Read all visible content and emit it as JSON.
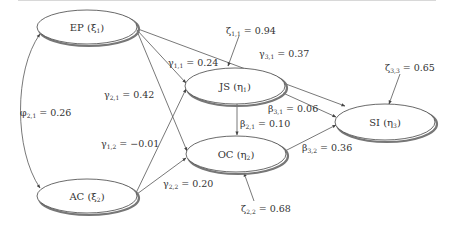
{
  "diagram": {
    "type": "structural-equation-model",
    "nodes": [
      {
        "id": "EP",
        "label": "EP",
        "symbol": "ξ",
        "sub": "1",
        "cx": 87,
        "cy": 27,
        "rx": 50,
        "ry": 17
      },
      {
        "id": "AC",
        "label": "AC",
        "symbol": "ξ",
        "sub": "2",
        "cx": 87,
        "cy": 196,
        "rx": 50,
        "ry": 17
      },
      {
        "id": "JS",
        "label": "JS",
        "symbol": "η",
        "sub": "1",
        "cx": 235,
        "cy": 86,
        "rx": 50,
        "ry": 18
      },
      {
        "id": "OC",
        "label": "OC",
        "symbol": "η",
        "sub": "2",
        "cx": 236,
        "cy": 154,
        "rx": 50,
        "ry": 18
      },
      {
        "id": "SI",
        "label": "SI",
        "symbol": "η",
        "sub": "3",
        "cx": 385,
        "cy": 122,
        "rx": 50,
        "ry": 18
      }
    ],
    "edges": [
      {
        "id": "phi21",
        "from": "EP",
        "to": "AC",
        "symbol": "φ",
        "sub": "2,1",
        "value": "0.26",
        "label": "φ2,1 = 0.26",
        "bidirectional": true
      },
      {
        "id": "gamma11",
        "from": "EP",
        "to": "JS",
        "symbol": "γ",
        "sub": "1,1",
        "value": "0.24",
        "label": "γ1,1 = 0.24"
      },
      {
        "id": "gamma21",
        "from": "EP",
        "to": "OC",
        "symbol": "γ",
        "sub": "2,1",
        "value": "0.42",
        "label": "γ2,1 = 0.42"
      },
      {
        "id": "gamma31",
        "from": "EP",
        "to": "SI",
        "symbol": "γ",
        "sub": "3,1",
        "value": "0.37",
        "label": "γ3,1 = 0.37"
      },
      {
        "id": "gamma12",
        "from": "AC",
        "to": "JS",
        "symbol": "γ",
        "sub": "1,2",
        "value": "−0.01",
        "label": "γ1,2 = −0.01"
      },
      {
        "id": "gamma22",
        "from": "AC",
        "to": "OC",
        "symbol": "γ",
        "sub": "2,2",
        "value": "0.20",
        "label": "γ2,2 = 0.20"
      },
      {
        "id": "beta21",
        "from": "JS",
        "to": "OC",
        "symbol": "β",
        "sub": "2,1",
        "value": "0.10",
        "label": "β2,1 = 0.10"
      },
      {
        "id": "beta31",
        "from": "JS",
        "to": "SI",
        "symbol": "β",
        "sub": "3,1",
        "value": "0.06",
        "label": "β3,1 = 0.06"
      },
      {
        "id": "beta32",
        "from": "OC",
        "to": "SI",
        "symbol": "β",
        "sub": "3,2",
        "value": "0.36",
        "label": "β3,2 = 0.36"
      }
    ],
    "disturbances": [
      {
        "id": "zeta11",
        "target": "JS",
        "symbol": "ζ",
        "sub": "1,1",
        "value": "0.94",
        "label": "ζ1,1 = 0.94"
      },
      {
        "id": "zeta22",
        "target": "OC",
        "symbol": "ζ",
        "sub": "2,2",
        "value": "0.68",
        "label": "ζ2,2 = 0.68"
      },
      {
        "id": "zeta33",
        "target": "SI",
        "symbol": "ζ",
        "sub": "3,3",
        "value": "0.65",
        "label": "ζ3,3 = 0.65"
      }
    ]
  },
  "text": {
    "EP": {
      "name": "EP (",
      "sym": "ξ",
      "sub": "1",
      "close": ")"
    },
    "AC": {
      "name": "AC (",
      "sym": "ξ",
      "sub": "2",
      "close": ")"
    },
    "JS": {
      "name": "JS (",
      "sym": "η",
      "sub": "1",
      "close": ")"
    },
    "OC": {
      "name": "OC (",
      "sym": "η",
      "sub": "2",
      "close": ")"
    },
    "SI": {
      "name": "SI (",
      "sym": "η",
      "sub": "3",
      "close": ")"
    },
    "phi21": {
      "sym": "φ",
      "sub": "2,1",
      "val": " = 0.26"
    },
    "gamma11": {
      "sym": "γ",
      "sub": "1,1",
      "val": " = 0.24"
    },
    "gamma21": {
      "sym": "γ",
      "sub": "2,1",
      "val": " = 0.42"
    },
    "gamma31": {
      "sym": "γ",
      "sub": "3,1",
      "val": " = 0.37"
    },
    "gamma12": {
      "sym": "γ",
      "sub": "1,2",
      "val": " = −0.01"
    },
    "gamma22": {
      "sym": "γ",
      "sub": "2,2",
      "val": " = 0.20"
    },
    "beta21": {
      "sym": "β",
      "sub": "2,1",
      "val": " = 0.10"
    },
    "beta31": {
      "sym": "β",
      "sub": "3,1",
      "val": " = 0.06"
    },
    "beta32": {
      "sym": "β",
      "sub": "3,2",
      "val": " = 0.36"
    },
    "zeta11": {
      "sym": "ζ",
      "sub": "1,1",
      "val": " = 0.94"
    },
    "zeta22": {
      "sym": "ζ",
      "sub": "2,2",
      "val": " = 0.68"
    },
    "zeta33": {
      "sym": "ζ",
      "sub": "3,3",
      "val": " = 0.65"
    }
  }
}
